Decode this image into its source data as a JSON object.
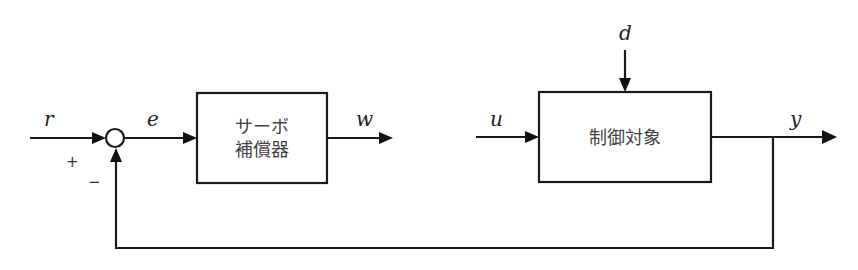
{
  "diagram": {
    "type": "block-diagram",
    "signals": {
      "r": "r",
      "e": "e",
      "w": "w",
      "u": "u",
      "d": "d",
      "y": "y"
    },
    "summing_junction": {
      "plus_sign": "+",
      "minus_sign": "−"
    },
    "blocks": {
      "servo_compensator": {
        "line1": "サーボ",
        "line2": "補償器"
      },
      "plant": {
        "label": "制御対象"
      }
    },
    "colors": {
      "line": "#1a1a1a",
      "background": "#ffffff"
    }
  }
}
